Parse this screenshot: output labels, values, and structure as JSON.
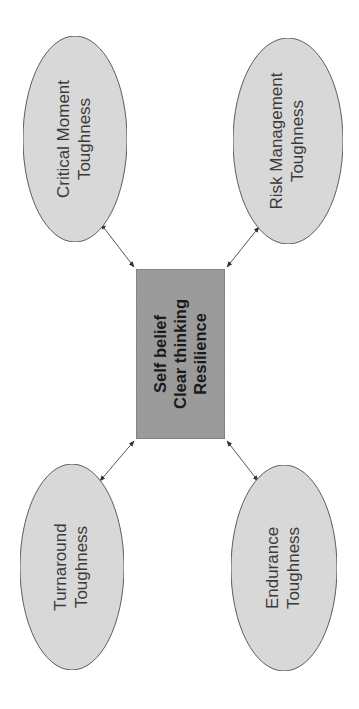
{
  "diagram": {
    "orientation": "rotated-90-ccw",
    "colors": {
      "background": "#ffffff",
      "ellipse_fill": "#d9d9d9",
      "ellipse_stroke": "#5a5a5a",
      "center_fill": "#9a9a9a",
      "center_stroke": "#6a6a6a",
      "connector": "#555555",
      "text": "#333333"
    },
    "center": {
      "lines": [
        "Self belief",
        "Clear thinking",
        "Resilience"
      ]
    },
    "nodes": [
      {
        "id": "critical-moment",
        "lines": [
          "Critical Moment",
          "Toughness"
        ],
        "position": "top-left"
      },
      {
        "id": "risk-management",
        "lines": [
          "Risk Management",
          "Toughness"
        ],
        "position": "top-right"
      },
      {
        "id": "turnaround",
        "lines": [
          "Turnaround",
          "Toughness"
        ],
        "position": "bottom-left"
      },
      {
        "id": "endurance",
        "lines": [
          "Endurance",
          "Toughness"
        ],
        "position": "bottom-right"
      }
    ],
    "connectors": [
      {
        "from": "center",
        "to": "critical-moment",
        "style": "double-arrow"
      },
      {
        "from": "center",
        "to": "risk-management",
        "style": "double-arrow"
      },
      {
        "from": "center",
        "to": "turnaround",
        "style": "double-arrow"
      },
      {
        "from": "center",
        "to": "endurance",
        "style": "double-arrow"
      }
    ]
  }
}
